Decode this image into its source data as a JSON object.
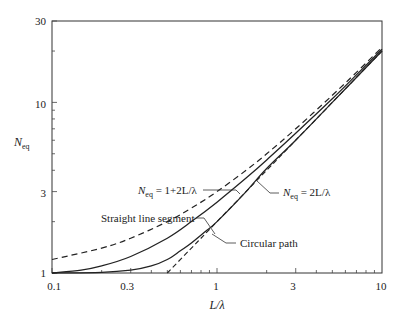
{
  "chart_data": {
    "type": "line",
    "title": "",
    "xlabel": "L/λ",
    "ylabel": "N_eq",
    "xscale": "log",
    "yscale": "log",
    "xlim": [
      0.1,
      10
    ],
    "ylim": [
      1,
      30
    ],
    "grid": false,
    "x_ticks": [
      "0.1",
      "0.3",
      "1",
      "3",
      "10"
    ],
    "y_ticks": [
      "1",
      "3",
      "10",
      "30"
    ],
    "series": [
      {
        "name": "N_eq = 1+2L/λ",
        "style": "dashed",
        "x": [
          0.1,
          0.2,
          0.3,
          0.5,
          0.7,
          1,
          1.5,
          2,
          3,
          5,
          7,
          10
        ],
        "y": [
          1.2,
          1.4,
          1.6,
          2.0,
          2.4,
          3.0,
          4.0,
          5.0,
          7.0,
          11.0,
          15.0,
          21.0
        ]
      },
      {
        "name": "Straight line segment",
        "style": "solid",
        "x": [
          0.1,
          0.15,
          0.2,
          0.3,
          0.5,
          0.7,
          1,
          1.5,
          2,
          3,
          5,
          7,
          10
        ],
        "y": [
          1.0,
          1.04,
          1.1,
          1.25,
          1.6,
          2.0,
          2.6,
          3.6,
          4.6,
          6.6,
          10.5,
          14.5,
          20.5
        ]
      },
      {
        "name": "Circular path",
        "style": "solid",
        "x": [
          0.1,
          0.2,
          0.3,
          0.4,
          0.5,
          0.6,
          0.7,
          0.85,
          1,
          1.5,
          2,
          3,
          5,
          7,
          10
        ],
        "y": [
          1.0,
          1.01,
          1.04,
          1.1,
          1.2,
          1.35,
          1.5,
          1.75,
          2.0,
          3.0,
          4.1,
          6.0,
          10.0,
          14.0,
          20.0
        ]
      },
      {
        "name": "N_eq = 2L/λ",
        "style": "dashed",
        "x": [
          0.5,
          0.7,
          1,
          2,
          3,
          5,
          10
        ],
        "y": [
          1.0,
          1.4,
          2.0,
          4.0,
          6.0,
          10.0,
          20.0
        ]
      }
    ],
    "annotations": [
      {
        "text": "N_eq = 1+2L/λ",
        "points_to": "upper dashed curve"
      },
      {
        "text": "Straight line segment",
        "points_to": "upper solid curve"
      },
      {
        "text": "N_eq = 2L/λ",
        "points_to": "lower dashed line"
      },
      {
        "text": "Circular path",
        "points_to": "lower solid curve"
      }
    ]
  },
  "labels": {
    "y_axis_main": "N",
    "y_axis_sub": "eq",
    "x_axis": "L/λ",
    "annot_1_main": "N",
    "annot_1_sub": "eq",
    "annot_1_rest": " = 1+2L/λ",
    "annot_2": "Straight line segment",
    "annot_3_main": "N",
    "annot_3_sub": "eq",
    "annot_3_rest": " = 2L/λ",
    "annot_4": "Circular path",
    "xt0": "0.1",
    "xt1": "0.3",
    "xt2": "1",
    "xt3": "3",
    "xt4": "10",
    "yt0": "1",
    "yt1": "3",
    "yt2": "10",
    "yt3": "30"
  }
}
